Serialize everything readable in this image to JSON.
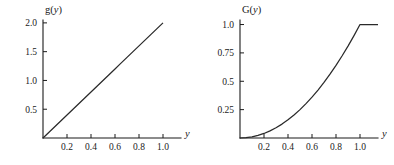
{
  "figure": {
    "background": "#ffffff",
    "ink_color": "#1a1a1a",
    "curve_color": "#2a2a2a",
    "panel_count": 2
  },
  "chart_data": [
    {
      "id": "left",
      "type": "line",
      "title": "",
      "ylabel": "g(y)",
      "ylabel_base": "g",
      "ylabel_arg": "y",
      "xlabel": "y",
      "xlim": [
        0,
        1.15
      ],
      "ylim": [
        0,
        2.05
      ],
      "grid": false,
      "legend": null,
      "xticks": [
        0.2,
        0.4,
        0.6,
        0.8,
        1.0
      ],
      "xticklabels": [
        "0.2",
        "0.4",
        "0.6",
        "0.8",
        "1.0"
      ],
      "yticks": [
        0.5,
        1.0,
        1.5,
        2.0
      ],
      "yticklabels": [
        "0.5",
        "1.0",
        "1.5",
        "2.0"
      ],
      "series": [
        {
          "name": "g(y) = 2y",
          "x": [
            0.0,
            0.05,
            0.1,
            0.15,
            0.2,
            0.25,
            0.3,
            0.35,
            0.4,
            0.45,
            0.5,
            0.55,
            0.6,
            0.65,
            0.7,
            0.75,
            0.8,
            0.85,
            0.9,
            0.95,
            1.0
          ],
          "y": [
            0.0,
            0.1,
            0.2,
            0.3,
            0.4,
            0.5,
            0.6,
            0.7,
            0.8,
            0.9,
            1.0,
            1.1,
            1.2,
            1.3,
            1.4,
            1.5,
            1.6,
            1.7,
            1.8,
            1.9,
            2.0
          ]
        }
      ]
    },
    {
      "id": "right",
      "type": "line",
      "title": "",
      "ylabel": "G(y)",
      "ylabel_base": "G",
      "ylabel_arg": "y",
      "xlabel": "y",
      "xlim": [
        0,
        1.15
      ],
      "ylim": [
        0,
        1.04
      ],
      "grid": false,
      "legend": null,
      "xticks": [
        0.2,
        0.4,
        0.6,
        0.8,
        1.0
      ],
      "xticklabels": [
        "0.2",
        "0.4",
        "0.6",
        "0.8",
        "1.0"
      ],
      "yticks": [
        0.25,
        0.5,
        0.75,
        1.0
      ],
      "yticklabels": [
        "0.25",
        "0.5",
        "0.75",
        "1.0"
      ],
      "series": [
        {
          "name": "G(y) = y^2 for y<=1, 1 for y>1",
          "x": [
            0.0,
            0.05,
            0.1,
            0.15,
            0.2,
            0.25,
            0.3,
            0.35,
            0.4,
            0.45,
            0.5,
            0.55,
            0.6,
            0.65,
            0.7,
            0.75,
            0.8,
            0.85,
            0.9,
            0.95,
            1.0,
            1.05,
            1.1,
            1.15
          ],
          "y": [
            0.0,
            0.0025,
            0.01,
            0.0225,
            0.04,
            0.0625,
            0.09,
            0.1225,
            0.16,
            0.2025,
            0.25,
            0.3025,
            0.36,
            0.4225,
            0.49,
            0.5625,
            0.64,
            0.7225,
            0.81,
            0.9025,
            1.0,
            1.0,
            1.0,
            1.0
          ]
        }
      ]
    }
  ]
}
